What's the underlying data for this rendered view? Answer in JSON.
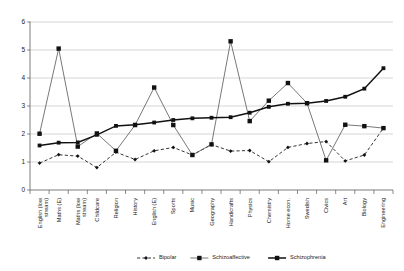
{
  "chart_data": {
    "type": "line",
    "title": "",
    "xlabel": "",
    "ylabel": "",
    "ylim": [
      0,
      6
    ],
    "yticks": [
      0,
      1,
      2,
      3,
      4,
      5,
      6
    ],
    "grid": true,
    "legend_position": "bottom",
    "categories": [
      "English (low stream)",
      "Maths (E)",
      "Maths (low stream)",
      "Childcare",
      "Religion",
      "History",
      "English (E)",
      "Sports",
      "Music",
      "Geography",
      "Handicrafts",
      "Physics",
      "Chemistry",
      "Home econ.",
      "Swedish",
      "Civics",
      "Art",
      "Biology",
      "Engineering"
    ],
    "series": [
      {
        "name": "Bipolar",
        "marker": "diamond",
        "line_style": "dashed",
        "values": [
          0.96,
          1.26,
          1.21,
          0.8,
          1.35,
          1.09,
          1.4,
          1.52,
          1.25,
          1.62,
          1.39,
          1.41,
          1.01,
          1.52,
          1.66,
          1.73,
          1.04,
          1.25,
          2.21
        ]
      },
      {
        "name": "Schizoaffective",
        "marker": "square",
        "line_style": "solid-thin",
        "values": [
          2.01,
          5.05,
          1.55,
          2.02,
          1.4,
          2.32,
          3.66,
          2.32,
          1.25,
          1.63,
          5.31,
          2.46,
          3.19,
          3.82,
          3.1,
          1.06,
          2.33,
          2.28,
          2.21
        ]
      },
      {
        "name": "Schizophrenia",
        "marker": "square",
        "line_style": "solid-thick",
        "values": [
          1.59,
          1.69,
          1.7,
          1.97,
          2.29,
          2.33,
          2.41,
          2.5,
          2.56,
          2.58,
          2.6,
          2.76,
          2.97,
          3.08,
          3.1,
          3.18,
          3.33,
          3.62,
          4.35
        ]
      }
    ]
  }
}
